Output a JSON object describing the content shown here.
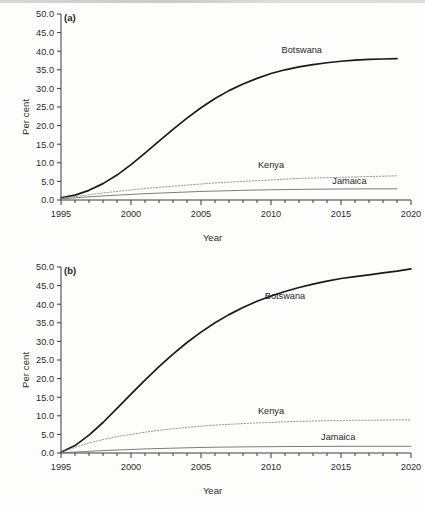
{
  "figure": {
    "panels": [
      {
        "tag": "(a)",
        "xlabel": "Year",
        "ylabel": "Per cent"
      },
      {
        "tag": "(b)",
        "xlabel": "Year",
        "ylabel": "Per cent"
      }
    ]
  },
  "chart_data": [
    {
      "type": "line",
      "title": "",
      "panel": "(a)",
      "xlabel": "Year",
      "ylabel": "Per cent",
      "xlim": [
        1995,
        2020
      ],
      "ylim": [
        0,
        50
      ],
      "xticks": [
        1995,
        2000,
        2005,
        2010,
        2015,
        2020
      ],
      "xtick_labels": [
        "1995",
        "2000",
        "2005",
        "2010",
        "2015",
        "2020"
      ],
      "yticks": [
        0,
        5,
        10,
        15,
        20,
        25,
        30,
        35,
        40,
        45,
        50
      ],
      "ytick_labels": [
        "0.0",
        "5.0",
        "10.0",
        "15.0",
        "20.0",
        "25.0",
        "30.0",
        "35.0",
        "40.0",
        "45.0",
        "50.0"
      ],
      "minor_xticks_step": 1,
      "grid": false,
      "legend": "inline-annotations",
      "x": [
        1995,
        1996,
        1997,
        1998,
        1999,
        2000,
        2001,
        2002,
        2003,
        2004,
        2005,
        2006,
        2007,
        2008,
        2009,
        2010,
        2011,
        2012,
        2013,
        2014,
        2015,
        2016,
        2017,
        2018,
        2019
      ],
      "series": [
        {
          "name": "Botswana",
          "style": "solid-thick",
          "color": "#1a1a1a",
          "label_x": 2012.2,
          "label_y": 39.5,
          "values": [
            0.6,
            1.3,
            2.6,
            4.4,
            6.7,
            9.5,
            12.6,
            15.8,
            19.0,
            22.0,
            24.8,
            27.3,
            29.4,
            31.2,
            32.7,
            34.0,
            35.0,
            35.8,
            36.4,
            36.9,
            37.3,
            37.6,
            37.8,
            37.9,
            38.0
          ]
        },
        {
          "name": "Kenya",
          "style": "dotted",
          "color": "#8e8e8e",
          "label_x": 2010.0,
          "label_y": 8.6,
          "values": [
            0.5,
            0.9,
            1.4,
            1.9,
            2.3,
            2.7,
            3.1,
            3.4,
            3.7,
            4.0,
            4.3,
            4.6,
            4.8,
            5.0,
            5.2,
            5.4,
            5.6,
            5.8,
            5.9,
            6.0,
            6.1,
            6.2,
            6.3,
            6.4,
            6.5
          ]
        },
        {
          "name": "Jamaica",
          "style": "solid-thin",
          "color": "#6e6e6e",
          "label_x": 2015.6,
          "label_y": 4.3,
          "values": [
            0.35,
            0.6,
            0.85,
            1.1,
            1.3,
            1.5,
            1.7,
            1.85,
            2.0,
            2.15,
            2.3,
            2.4,
            2.5,
            2.6,
            2.68,
            2.75,
            2.8,
            2.85,
            2.9,
            2.93,
            2.96,
            2.98,
            3.0,
            3.0,
            3.0
          ]
        }
      ]
    },
    {
      "type": "line",
      "title": "",
      "panel": "(b)",
      "xlabel": "Year",
      "ylabel": "Per cent",
      "xlim": [
        1995,
        2020
      ],
      "ylim": [
        0,
        50
      ],
      "xticks": [
        1995,
        2000,
        2005,
        2010,
        2015,
        2020
      ],
      "xtick_labels": [
        "1995",
        "2000",
        "2005",
        "2010",
        "2015",
        "2020"
      ],
      "yticks": [
        0,
        5,
        10,
        15,
        20,
        25,
        30,
        35,
        40,
        45,
        50
      ],
      "ytick_labels": [
        "0.0",
        "5.0",
        "10.0",
        "15.0",
        "20.0",
        "25.0",
        "30.0",
        "35.0",
        "40.0",
        "45.0",
        "50.0"
      ],
      "minor_xticks_step": 1,
      "grid": false,
      "legend": "inline-annotations",
      "x": [
        1995,
        1996,
        1997,
        1998,
        1999,
        2000,
        2001,
        2002,
        2003,
        2004,
        2005,
        2006,
        2007,
        2008,
        2009,
        2010,
        2011,
        2012,
        2013,
        2014,
        2015,
        2016,
        2017,
        2018,
        2019,
        2020
      ],
      "series": [
        {
          "name": "Botswana",
          "style": "solid-thick",
          "color": "#1a1a1a",
          "label_x": 2011.0,
          "label_y": 41.5,
          "values": [
            0.2,
            2.0,
            4.8,
            8.2,
            12.0,
            15.8,
            19.6,
            23.2,
            26.6,
            29.7,
            32.5,
            35.0,
            37.2,
            39.1,
            40.8,
            42.2,
            43.4,
            44.5,
            45.4,
            46.2,
            46.9,
            47.4,
            47.9,
            48.4,
            48.9,
            49.5
          ]
        },
        {
          "name": "Kenya",
          "style": "dotted",
          "color": "#8e8e8e",
          "label_x": 2010.0,
          "label_y": 10.6,
          "values": [
            0.2,
            1.5,
            2.7,
            3.6,
            4.4,
            5.0,
            5.6,
            6.1,
            6.5,
            6.9,
            7.2,
            7.5,
            7.7,
            7.9,
            8.1,
            8.2,
            8.4,
            8.5,
            8.6,
            8.7,
            8.7,
            8.8,
            8.8,
            8.85,
            8.9,
            8.9
          ]
        },
        {
          "name": "Jamaica",
          "style": "solid-thin",
          "color": "#6e6e6e",
          "label_x": 2014.8,
          "label_y": 3.6,
          "values": [
            0.1,
            0.25,
            0.45,
            0.65,
            0.8,
            0.95,
            1.1,
            1.2,
            1.3,
            1.4,
            1.48,
            1.55,
            1.6,
            1.65,
            1.68,
            1.7,
            1.73,
            1.75,
            1.77,
            1.78,
            1.79,
            1.8,
            1.8,
            1.8,
            1.8,
            1.8
          ]
        }
      ]
    }
  ]
}
